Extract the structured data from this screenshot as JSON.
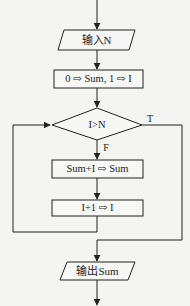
{
  "diagram": {
    "type": "flowchart",
    "nodes": [
      {
        "id": "input",
        "shape": "parallelogram",
        "label": "输入N"
      },
      {
        "id": "init",
        "shape": "rectangle",
        "label": "0 ⇨ Sum, 1 ⇨ I"
      },
      {
        "id": "cond",
        "shape": "diamond",
        "label": "I>N"
      },
      {
        "id": "accum",
        "shape": "rectangle",
        "label": "Sum+I ⇨ Sum"
      },
      {
        "id": "incr",
        "shape": "rectangle",
        "label": "I+1 ⇨ I"
      },
      {
        "id": "output",
        "shape": "parallelogram",
        "label": "输出Sum"
      }
    ],
    "edges": [
      {
        "from": "start",
        "to": "input"
      },
      {
        "from": "input",
        "to": "init"
      },
      {
        "from": "init",
        "to": "cond"
      },
      {
        "from": "cond",
        "to": "accum",
        "label": "F"
      },
      {
        "from": "accum",
        "to": "incr"
      },
      {
        "from": "incr",
        "to": "cond",
        "label": "loop"
      },
      {
        "from": "cond",
        "to": "output",
        "label": "T"
      },
      {
        "from": "output",
        "to": "end"
      }
    ],
    "branch_true": "T",
    "branch_false": "F",
    "line_color": "#222222",
    "background": "#f4f4f2"
  }
}
